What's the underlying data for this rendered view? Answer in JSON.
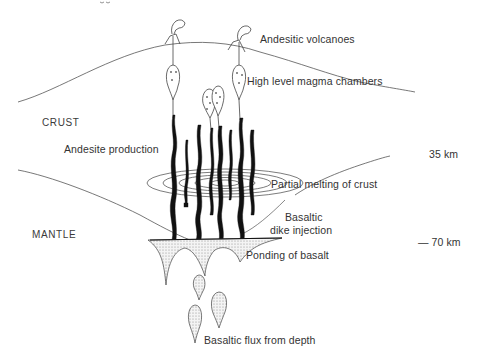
{
  "diagram": {
    "title_fragment": "...g y",
    "regions": {
      "crust": "CRUST",
      "mantle": "MANTLE"
    },
    "depth_markers": {
      "moho_top": "35 km",
      "moho_base": "— 70 km"
    },
    "labels": {
      "andesitic_volcanoes": "Andesitic volcanoes",
      "high_level_magma_chambers": "High level magma chambers",
      "andesite_production": "Andesite production",
      "partial_melting": "Partial melting of crust",
      "basaltic_dike_line1": "Basaltic",
      "basaltic_dike_line2": "dike injection",
      "ponding_of_basalt": "Ponding of basalt",
      "basaltic_flux": "Basaltic flux from depth"
    },
    "colors": {
      "ink": "#1a1a1a",
      "line": "#555555",
      "text": "#333333",
      "stipple": "#bdbdbd",
      "background": "#ffffff"
    }
  }
}
